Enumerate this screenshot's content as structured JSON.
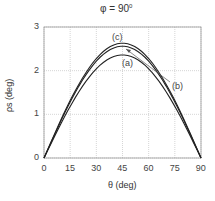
{
  "chart_data": {
    "type": "line",
    "title": "φ = 90",
    "title_sup": "0",
    "xlabel": "θ (deg)",
    "ylabel": "ρs (deg)",
    "xlim": [
      0,
      90
    ],
    "ylim": [
      0,
      3
    ],
    "xticks": [
      "0",
      "15",
      "30",
      "45",
      "60",
      "75",
      "90"
    ],
    "yticks": [
      "0",
      "1",
      "2",
      "3"
    ],
    "grid": true,
    "x": [
      0,
      15,
      30,
      45,
      60,
      75,
      90
    ],
    "series": [
      {
        "name": "(a)",
        "values": [
          0,
          1.18,
          2.04,
          2.36,
          2.04,
          1.18,
          0
        ]
      },
      {
        "name": "(b)",
        "values": [
          0,
          1.28,
          2.22,
          2.56,
          2.22,
          1.28,
          0
        ]
      },
      {
        "name": "(c)",
        "values": [
          0,
          1.32,
          2.28,
          2.63,
          2.28,
          1.32,
          0
        ]
      }
    ],
    "annotations": [
      "(a)",
      "(b)",
      "(c)"
    ]
  }
}
